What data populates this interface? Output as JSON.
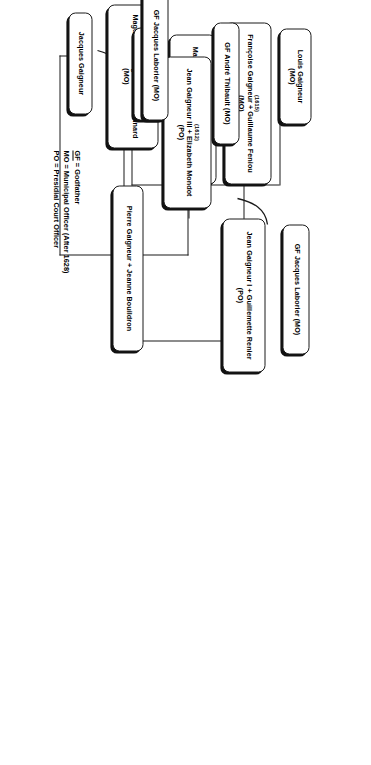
{
  "diagram": {
    "type": "genealogy-tree",
    "orientation": "rotated-90-clockwise",
    "page_background": "#ffffff",
    "line_color": "#1a1a1a",
    "text_color": "#000000"
  },
  "legend": {
    "lines": [
      {
        "abbr": "GF",
        "text": " = Godfather"
      },
      {
        "abbr": "MO",
        "text": " = Municipal Officer (After 1628)"
      },
      {
        "abbr": "PO",
        "text": " = Presidial Court Officer"
      }
    ]
  },
  "nodes": [
    {
      "id": "louis-gaigneur",
      "name": "Louis Gaigneur",
      "year": "",
      "role": "(MO)"
    },
    {
      "id": "francoise-gaigneur",
      "name": "Françoise Gaigneur + Guillaume Feniou",
      "year": "(1615)",
      "role": "(MO)"
    },
    {
      "id": "marie-gaigneur",
      "name": "Marie Gaigneur + Gabriel Picaudeau",
      "year": "(1617)",
      "role": "(MO)"
    },
    {
      "id": "magdeleine-gaigneur",
      "name": "Magdeleine Gaigneur + Jean Pinard",
      "year": "(1608)",
      "role": "(MO)"
    },
    {
      "id": "jean-gaigneur-i",
      "name": "Jean Gaigneur I + Guillemette Renier",
      "year": "",
      "role": "(PO)"
    },
    {
      "id": "gf-jacques-laborier-top",
      "name": "GF Jacques Laborier (MO)",
      "year": "",
      "role": ""
    },
    {
      "id": "jean-gaigneur-iii",
      "name": "Jean Gaigneur III + Elizabeth Mondot",
      "year": "(1612)",
      "role": "(PO)"
    },
    {
      "id": "gf-andre-thibault",
      "name": "GF André Thibault (MO)",
      "year": "",
      "role": ""
    },
    {
      "id": "andre-gaigneur",
      "name": "André Gaigneur",
      "year": "",
      "role": "(MO)"
    },
    {
      "id": "gf-jacques-laborier-bottom",
      "name": "GF Jacques Laborier (MO)",
      "year": "",
      "role": ""
    },
    {
      "id": "jacques-gaigneur",
      "name": "Jacques Gaigneur",
      "year": "",
      "role": ""
    },
    {
      "id": "pierre-gaigneur",
      "name": "Pierre Gaigneur + Jeanne Bouildron",
      "year": "",
      "role": ""
    }
  ]
}
